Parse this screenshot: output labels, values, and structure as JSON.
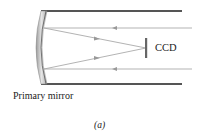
{
  "diagram": {
    "labels": {
      "ccd": "CCD",
      "primary_mirror": "Primary mirror",
      "caption": "(a)"
    },
    "colors": {
      "tube": "#555555",
      "mirror": "#bcbcbc",
      "rays": "#a8a8a8",
      "ccd": "#666666",
      "text": "#222222"
    },
    "elements": {
      "tube_top_y": 11,
      "tube_bottom_y": 84,
      "focus_point": [
        146,
        48
      ],
      "incoming_ray_y": [
        28,
        69
      ]
    }
  }
}
